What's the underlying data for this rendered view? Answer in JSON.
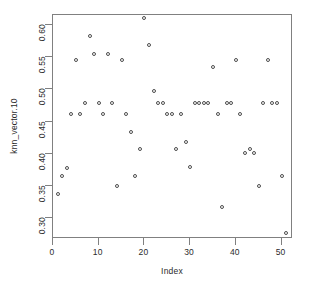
{
  "chart_data": {
    "type": "scatter",
    "title": "",
    "xlabel": "Index",
    "ylabel": "knn_vector.10",
    "xlim": [
      0,
      52.5
    ],
    "ylim": [
      0.268,
      0.615
    ],
    "grid": false,
    "legend": null,
    "marker": "open-circle",
    "marker_color": "#4d4d4d",
    "xticks": [
      0,
      10,
      20,
      30,
      40,
      50
    ],
    "xticklabels": [
      "0",
      "10",
      "20",
      "30",
      "40",
      "50"
    ],
    "yticks": [
      0.3,
      0.35,
      0.4,
      0.45,
      0.5,
      0.55,
      0.6
    ],
    "yticklabels": [
      "0.30",
      "0.35",
      "0.40",
      "0.45",
      "0.50",
      "0.55",
      "0.60"
    ],
    "x": [
      1,
      2,
      3,
      4,
      5,
      6,
      7,
      8,
      9,
      10,
      11,
      12,
      13,
      14,
      15,
      16,
      17,
      18,
      19,
      20,
      21,
      22,
      23,
      24,
      25,
      26,
      27,
      28,
      29,
      30,
      31,
      32,
      33,
      34,
      35,
      36,
      37,
      38,
      39,
      40,
      41,
      42,
      43,
      44,
      45,
      46,
      47,
      48,
      49,
      50,
      51
    ],
    "y": [
      0.338,
      0.365,
      0.378,
      0.462,
      0.545,
      0.462,
      0.478,
      0.583,
      0.555,
      0.478,
      0.462,
      0.555,
      0.478,
      0.35,
      0.545,
      0.462,
      0.433,
      0.365,
      0.408,
      0.61,
      0.568,
      0.497,
      0.478,
      0.478,
      0.462,
      0.462,
      0.408,
      0.462,
      0.418,
      0.38,
      0.478,
      0.478,
      0.478,
      0.478,
      0.535,
      0.462,
      0.318,
      0.478,
      0.478,
      0.545,
      0.462,
      0.401,
      0.408,
      0.401,
      0.35,
      0.478,
      0.546,
      0.478,
      0.478,
      0.365,
      0.277
    ]
  },
  "axes": {
    "x_title": "Index",
    "y_title": "knn_vector.10"
  }
}
